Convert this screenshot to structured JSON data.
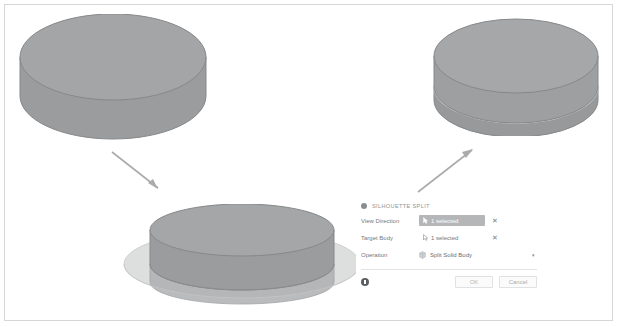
{
  "scene": {
    "before_model": {
      "name": "solid-cylinder-before",
      "description": "Single grey solid cylinder (disc) in isometric view"
    },
    "preview_model": {
      "name": "cylinder-with-silhouette-plane",
      "description": "Translucent cylinder intersected by a large horizontal silhouette plane ellipse"
    },
    "after_model": {
      "name": "split-cylinder-after",
      "description": "Cylinder split into two solid bodies by a horizontal seam near the bottom"
    },
    "arrows": [
      {
        "name": "arrow-down-right",
        "direction": "down-right"
      },
      {
        "name": "arrow-up-right",
        "direction": "up-right"
      }
    ],
    "colors": {
      "solid_fill": "#9a9c9e",
      "solid_top": "#a2a4a6",
      "outline": "#8d8f91",
      "plane_fill": "#d9dadb",
      "arrow": "#a9abad",
      "frame": "#d6d6d6"
    }
  },
  "dialog": {
    "title": "SILHOUETTE SPLIT",
    "header_icon": "silhouette-split-icon",
    "rows": [
      {
        "label": "View Direction",
        "value": "1 selected",
        "state": "active",
        "field_icon": "cursor-arrow-icon",
        "clear_label": "✕"
      },
      {
        "label": "Target Body",
        "value": "1 selected",
        "state": "plain",
        "field_icon": "cursor-select-icon",
        "clear_label": "✕"
      },
      {
        "label": "Operation",
        "value": "Split Solid Body",
        "state": "dropdown",
        "field_icon": "solid-body-icon",
        "caret_label": "▾"
      }
    ],
    "footer": {
      "info_icon": "info-icon",
      "ok_label": "OK",
      "cancel_label": "Cancel"
    }
  }
}
